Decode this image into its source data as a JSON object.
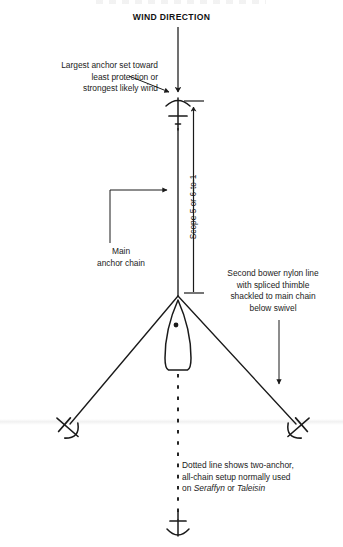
{
  "figure": {
    "title_visible": false,
    "wind_label": "WIND DIRECTION",
    "background_color": "#ffffff",
    "ink_color": "#1a1a1a"
  },
  "annotations": {
    "largest_anchor": "Largest anchor set toward\nleast protection or\nstrongest likely wind",
    "main_anchor_chain": "Main\nanchor chain",
    "second_bower": "Second bower nylon line\nwith spliced thimble\nshackled to main chain\nbelow swivel",
    "scope": "Scope 5 or 6-to-1",
    "dotted_line_prefix": "Dotted line shows two-anchor,\nall-chain setup normally used\non ",
    "dotted_line_boat_one": "Seraffyn",
    "dotted_line_joiner": " or ",
    "dotted_line_boat_two": "Taleisin"
  },
  "icons": {
    "wind_arrow": "wind-direction-arrow-icon",
    "main_anchor": "main-anchor-icon",
    "port_anchor": "port-bower-anchor-icon",
    "starboard_anchor": "starboard-bower-anchor-icon",
    "stern_anchor": "stern-anchor-icon",
    "boat": "boat-hull-icon",
    "mast": "mast-dot-icon",
    "scope_dimension": "scope-dimension-arrow-icon",
    "leader_main_chain": "main-chain-leader-icon",
    "leader_largest_anchor": "largest-anchor-leader-icon",
    "leader_second_bower": "second-bower-leader-icon"
  },
  "geometry": {
    "centerline_x": 178,
    "anchor_top_y": 102,
    "bridle_apex_y": 296,
    "boat_bow_y": 300,
    "boat_stern_y": 370,
    "port_anchor_x": 66,
    "starboard_anchor_x": 300,
    "bower_anchor_y": 426,
    "stern_anchor_y": 530,
    "scope_ratio_low": 5,
    "scope_ratio_high": 6
  }
}
